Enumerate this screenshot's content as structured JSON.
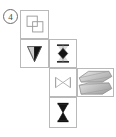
{
  "figure": {
    "label": "4",
    "label_style": "circled-number",
    "background_color": "#ffffff",
    "grid_line_color": "#b9b9b9",
    "ink_black": "#111111",
    "ink_gray": "#9a9a9a",
    "ink_light_gray": "#cfcfcf",
    "layout": "net-of-solid-cross-arrangement",
    "cells": [
      {
        "id": "cell-squares",
        "name": "overlapping-squares",
        "row": 1,
        "column": 1,
        "shape": "two overlapping outlined squares offset diagonally",
        "fill": "none",
        "stroke": "#9a9a9a"
      },
      {
        "id": "cell-triangle",
        "name": "half-shaded-down-triangle",
        "row": 2,
        "column": 1,
        "shape": "downward pointing triangle, left half light gray, right half black",
        "fill": "split",
        "stroke": "#555555"
      },
      {
        "id": "cell-diamond",
        "name": "black-diamond-with-bars",
        "row": 2,
        "column": 2,
        "shape": "black diamond between two horizontal bars with faint hourglass",
        "fill": "#111111",
        "stroke": "#111111"
      },
      {
        "id": "cell-bowtie",
        "name": "bowtie-outline",
        "row": 3,
        "column": 2,
        "shape": "two horizontally opposed triangles forming a bowtie, outlined",
        "fill": "none",
        "stroke": "#b0b0b0"
      },
      {
        "id": "cell-prisms",
        "name": "stacked-shaded-prisms",
        "row": 3,
        "column": 3,
        "shape": "two stacked elongated hexagonal prisms with gradient shading",
        "fill": "#d2d2d2",
        "stroke": "#8a8a8a"
      },
      {
        "id": "cell-hourglass",
        "name": "black-hourglass-with-bars",
        "row": 4,
        "column": 2,
        "shape": "black hourglass of two triangles meeting at a point, with top and bottom bars",
        "fill": "#111111",
        "stroke": "#111111"
      }
    ]
  }
}
